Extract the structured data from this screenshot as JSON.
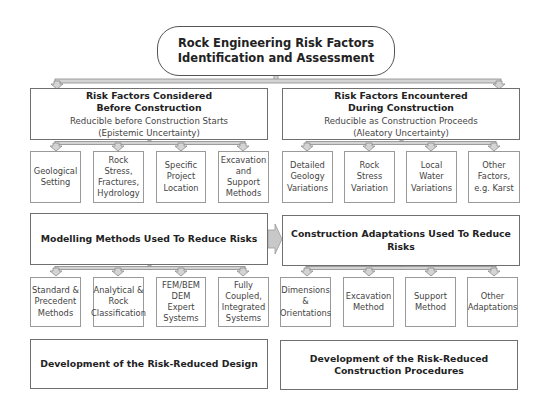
{
  "title": {
    "line1": "Rock Engineering Risk Factors",
    "line2": "Identification and Assessment"
  },
  "left_column": {
    "header": {
      "line1": "Risk Factors Considered",
      "line2": "Before Construction",
      "sub1": "Reducible before Construction Starts",
      "sub2": "(Epistemic Uncertainty)"
    },
    "factors": [
      {
        "label": "Geological\nSetting"
      },
      {
        "label": "Rock\nStress,\nFractures,\nHydrology"
      },
      {
        "label": "Specific\nProject\nLocation"
      },
      {
        "label": "Excavation\nand Support\nMethods"
      }
    ],
    "methods_header": "Modelling Methods Used To Reduce Risks",
    "methods": [
      {
        "label": "Standard &\nPrecedent\nMethods"
      },
      {
        "label": "Analytical &\nRock\nClassification\n "
      },
      {
        "label": "FEM/BEM\nDEM\nExpert\nSystems"
      },
      {
        "label": "Fully\nCoupled,\nIntegrated\nSystems"
      }
    ],
    "outcome": "Development of the Risk-Reduced Design"
  },
  "right_column": {
    "header": {
      "line1": "Risk Factors Encountered",
      "line2": "During Construction",
      "sub1": "Reducible as Construction Proceeds",
      "sub2": "(Aleatory Uncertainty)"
    },
    "factors": [
      {
        "label": "Detailed\nGeology\nVariations"
      },
      {
        "label": "Rock Stress\nVariation"
      },
      {
        "label": "Local  Water\nVariations"
      },
      {
        "label": "Other\nFactors,\ne.g. Karst"
      }
    ],
    "methods_header": "Construction Adaptations Used To Reduce Risks",
    "methods": [
      {
        "label": "Dimensions\n&\nOrientations"
      },
      {
        "label": "Excavation\nMethod"
      },
      {
        "label": "Support\nMethod"
      },
      {
        "label": "Other\nAdaptations"
      }
    ],
    "outcome": "Development of the Risk-Reduced\nConstruction Procedures"
  },
  "colors": {
    "border": "#6f6f6f",
    "connector_fill": "#cfcfcf",
    "connector_stroke": "#8a8a8a",
    "text": "#222222"
  }
}
